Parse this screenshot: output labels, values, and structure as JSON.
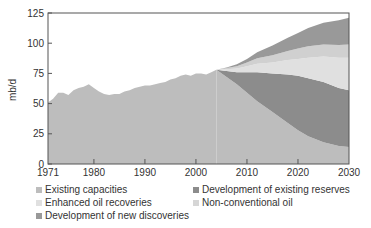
{
  "chart_data": {
    "type": "area",
    "title": "",
    "xlabel": "",
    "ylabel": "mb/d",
    "xlim": [
      1971,
      2030
    ],
    "ylim": [
      0,
      125
    ],
    "x_ticks": [
      1971,
      1980,
      1990,
      2000,
      2010,
      2020,
      2030
    ],
    "y_ticks": [
      0,
      25,
      50,
      75,
      100,
      125
    ],
    "grid": false,
    "legend_position": "bottom",
    "historical": {
      "name": "Existing capacities",
      "x": [
        1971,
        1972,
        1973,
        1974,
        1975,
        1976,
        1977,
        1978,
        1979,
        1980,
        1981,
        1982,
        1983,
        1984,
        1985,
        1986,
        1987,
        1988,
        1989,
        1990,
        1991,
        1992,
        1993,
        1994,
        1995,
        1996,
        1997,
        1998,
        1999,
        2000,
        2001,
        2002,
        2003,
        2004
      ],
      "values": [
        51,
        54,
        59,
        59,
        57,
        61,
        63,
        64,
        66,
        63,
        60,
        58,
        57,
        58,
        58,
        60,
        61,
        63,
        64,
        65,
        65,
        66,
        67,
        68,
        70,
        71,
        73,
        74,
        73,
        75,
        75,
        74,
        76,
        78
      ]
    },
    "x": [
      2004,
      2006,
      2008,
      2010,
      2012,
      2015,
      2018,
      2020,
      2022,
      2025,
      2028,
      2030
    ],
    "series": [
      {
        "name": "Existing capacities",
        "color": "#bdbdbd",
        "values": [
          78,
          72,
          66,
          59,
          52,
          43,
          34,
          28,
          23,
          18,
          15,
          14
        ]
      },
      {
        "name": "Development of existing reserves",
        "color": "#8c8c8c",
        "values": [
          0,
          5,
          10,
          17,
          24,
          32,
          40,
          45,
          48,
          50,
          48,
          47
        ]
      },
      {
        "name": "Enhanced oil recoveries",
        "color": "#e0e0e0",
        "values": [
          0,
          1.5,
          3,
          5,
          7,
          9,
          12,
          14,
          17,
          21,
          25,
          27
        ]
      },
      {
        "name": "Non-conventional oil",
        "color": "#d0d0d0",
        "values": [
          0,
          1,
          2,
          3,
          4.5,
          6,
          7.5,
          8.5,
          9.5,
          10,
          10.5,
          11
        ]
      },
      {
        "name": "Development of new discoveries",
        "color": "#999999",
        "values": [
          0,
          0.5,
          1.5,
          3,
          5,
          8,
          11,
          13,
          15,
          18,
          20.5,
          22
        ]
      }
    ],
    "legend": [
      {
        "label": "Existing capacities",
        "color": "#bdbdbd"
      },
      {
        "label": "Development of existing reserves",
        "color": "#8c8c8c"
      },
      {
        "label": "Enhanced oil recoveries",
        "color": "#e0e0e0"
      },
      {
        "label": "Non-conventional oil",
        "color": "#d0d0d0"
      },
      {
        "label": "Development of new discoveries",
        "color": "#999999"
      }
    ]
  },
  "axis": {
    "ylabel": "mb/d",
    "y_tick_labels": [
      "0",
      "25",
      "50",
      "75",
      "100",
      "125"
    ],
    "x_tick_labels": [
      "1971",
      "1980",
      "1990",
      "2000",
      "2010",
      "2020",
      "2030"
    ]
  },
  "legend": {
    "items": [
      {
        "label": "Existing capacities"
      },
      {
        "label": "Development of existing reserves"
      },
      {
        "label": "Enhanced oil recoveries"
      },
      {
        "label": "Non-conventional oil"
      },
      {
        "label": "Development of new discoveries"
      }
    ]
  }
}
